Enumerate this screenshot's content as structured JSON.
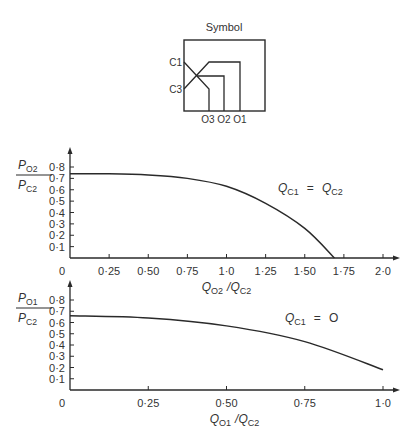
{
  "symbol": {
    "title": "Symbol",
    "inputs": [
      "C1",
      "C3"
    ],
    "outputs": [
      "O3",
      "O2",
      "O1"
    ]
  },
  "chart_data": [
    {
      "type": "line",
      "title": "",
      "ylabel": {
        "num": "P",
        "num_sub": "O2",
        "den": "P",
        "den_sub": "C2"
      },
      "xlabel": {
        "a": "Q",
        "a_sub": "O2",
        "sep": "/",
        "b": "Q",
        "b_sub": "C2"
      },
      "annotation": {
        "a": "Q",
        "a_sub": "C1",
        "eq": "=",
        "b": "Q",
        "b_sub": "C2"
      },
      "xlim": [
        0,
        2.0
      ],
      "ylim": [
        0,
        0.8
      ],
      "x_ticks": [
        "0",
        "0·25",
        "0·50",
        "0·75",
        "1·0",
        "1·25",
        "1·50",
        "1·75",
        "2·0"
      ],
      "y_ticks": [
        "0·1",
        "0·2",
        "0·3",
        "0·4",
        "0·5",
        "0·6",
        "0·7",
        "0·8"
      ],
      "grid": false,
      "x": [
        0,
        0.25,
        0.5,
        0.75,
        1.0,
        1.25,
        1.5,
        1.69
      ],
      "values": [
        0.74,
        0.74,
        0.73,
        0.7,
        0.63,
        0.48,
        0.26,
        0.0
      ]
    },
    {
      "type": "line",
      "title": "",
      "ylabel": {
        "num": "P",
        "num_sub": "O1",
        "den": "P",
        "den_sub": "C2"
      },
      "xlabel": {
        "a": "Q",
        "a_sub": "O1",
        "sep": "/",
        "b": "Q",
        "b_sub": "C2"
      },
      "annotation": {
        "a": "Q",
        "a_sub": "C1",
        "eq": "=",
        "b": "O",
        "b_sub": ""
      },
      "xlim": [
        0,
        1.0
      ],
      "ylim": [
        0,
        0.8
      ],
      "x_ticks": [
        "0",
        "0·25",
        "0·50",
        "0·75",
        "1·0"
      ],
      "y_ticks": [
        "0·1",
        "0·2",
        "0·3",
        "0·4",
        "0·5",
        "0·6",
        "0·7",
        "0·8"
      ],
      "grid": false,
      "x": [
        0,
        0.25,
        0.5,
        0.75,
        1.0
      ],
      "values": [
        0.66,
        0.64,
        0.57,
        0.43,
        0.18
      ]
    }
  ]
}
